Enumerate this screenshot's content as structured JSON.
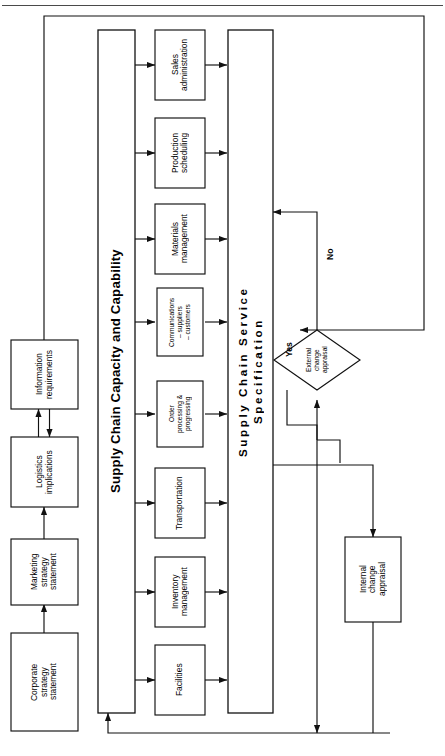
{
  "figure": {
    "orientation": "rotated-90-ccw",
    "line_color": "#1a1a1a",
    "box_fill": "#ffffff",
    "page_rule": true
  },
  "strategy_chain": {
    "boxes": [
      {
        "id": "corporate-strategy-statement",
        "label": "Corporate\nstrategy\nstatement"
      },
      {
        "id": "marketing-strategy-statement",
        "label": "Marketing\nstrategy\nstatement"
      },
      {
        "id": "logistics-implications",
        "label": "Logistics\nimplications"
      },
      {
        "id": "information-requirements",
        "label": "Information\nrequirements"
      }
    ]
  },
  "capacity_bar": {
    "id": "supply-chain-capacity-and-capability",
    "label": "Supply Chain Capacity and Capability"
  },
  "specification_bar": {
    "id": "supply-chain-service-specification",
    "label": "Supply Chain Service\nSpecification"
  },
  "functions": {
    "boxes": [
      {
        "id": "sales-administration",
        "label": "Sales\nadministration",
        "small": false
      },
      {
        "id": "production-scheduling",
        "label": "Production\nscheduling",
        "small": false
      },
      {
        "id": "materials-management",
        "label": "Materials\nmanagement",
        "small": false
      },
      {
        "id": "communications",
        "label": "Communications\n– suppliers\n– customers",
        "small": true
      },
      {
        "id": "order-processing-progressing",
        "label": "Order\nprocessing &\nprogressing",
        "small": true
      },
      {
        "id": "transportation",
        "label": "Transportation",
        "small": false
      },
      {
        "id": "inventory-management",
        "label": "Inventory\nmanagement",
        "small": false
      },
      {
        "id": "facilities",
        "label": "Facilities",
        "small": false
      }
    ]
  },
  "appraisal": {
    "external": {
      "id": "external-change-appraisal",
      "label": "External\nchange\nappraisal"
    },
    "internal": {
      "id": "internal-change-appraisal",
      "label": "Internal\nchange\nappraisal"
    },
    "branch_no": "No",
    "branch_yes": "Yes"
  }
}
